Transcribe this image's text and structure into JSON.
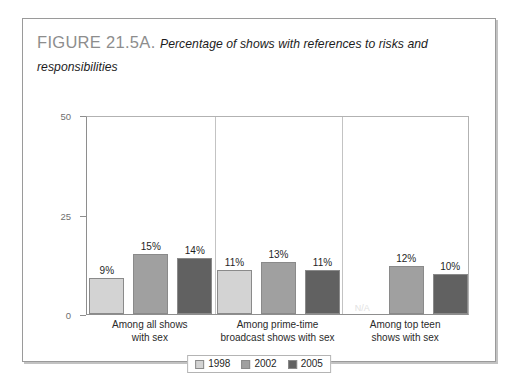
{
  "figure": {
    "number_label": "FIGURE 21.5A.",
    "caption": "Percentage of shows with references to risks and responsibilities"
  },
  "chart_data": {
    "type": "bar",
    "title": "Percentage of shows with references to risks and responsibilities",
    "xlabel": "",
    "ylabel": "",
    "ylim": [
      0,
      50
    ],
    "yticks": [
      0,
      25,
      50
    ],
    "ytick_labels": [
      "0",
      "25",
      "50"
    ],
    "grid": false,
    "legend_position": "bottom",
    "categories": [
      "Among all shows with sex",
      "Among prime-time broadcast shows with sex",
      "Among top teen shows with sex"
    ],
    "category_lines": [
      [
        "Among all shows",
        "with sex"
      ],
      [
        "Among prime-time",
        "broadcast shows with sex"
      ],
      [
        "Among top teen",
        "shows with sex"
      ]
    ],
    "series": [
      {
        "name": "1998",
        "color": "#d3d3d3",
        "values": [
          9,
          11,
          null
        ],
        "labels": [
          "9%",
          "11%",
          "N/A"
        ]
      },
      {
        "name": "2002",
        "color": "#a0a0a0",
        "values": [
          15,
          13,
          12
        ],
        "labels": [
          "15%",
          "13%",
          "12%"
        ]
      },
      {
        "name": "2005",
        "color": "#616161",
        "values": [
          14,
          11,
          10
        ],
        "labels": [
          "14%",
          "11%",
          "10%"
        ]
      }
    ],
    "annotations": [
      {
        "text": "N/A",
        "category": "Among top teen shows with sex",
        "series": "1998"
      }
    ]
  },
  "legend": {
    "items": [
      {
        "label": "1998",
        "color": "#d3d3d3"
      },
      {
        "label": "2002",
        "color": "#a0a0a0"
      },
      {
        "label": "2005",
        "color": "#616161"
      }
    ]
  }
}
